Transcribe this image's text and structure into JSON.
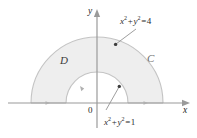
{
  "figure": {
    "type": "math-diagram",
    "background_color": "#ffffff",
    "fill_color": "#eeeeee",
    "stroke_color": "#c9c9c9",
    "axis_color": "#9a9a9a",
    "text_color": "#2b2b2b",
    "axes": {
      "y_axis_label": "y",
      "x_axis_label": "x",
      "origin_label": "0",
      "origin": {
        "x": 97,
        "y": 103
      },
      "x_axis_from": 8,
      "x_axis_to": 189,
      "y_axis_from": 128,
      "y_axis_to": 10
    },
    "region": {
      "region_label": "D",
      "curve_label": "C",
      "outer_radius_px": 66,
      "inner_radius_px": 31
    },
    "annotations": [
      {
        "name": "outer-circle-equation",
        "lhs_var1": "x",
        "exp1": "2",
        "operator": "+",
        "lhs_var2": "y",
        "exp2": "2",
        "equals": "=",
        "rhs": "4",
        "plain": "x^2 + y^2 = 4"
      },
      {
        "name": "inner-circle-equation",
        "lhs_var1": "x",
        "exp1": "2",
        "operator": "+",
        "lhs_var2": "y",
        "exp2": "2",
        "equals": "=",
        "rhs": "1",
        "plain": "x^2 + y^2 = 1"
      }
    ]
  }
}
